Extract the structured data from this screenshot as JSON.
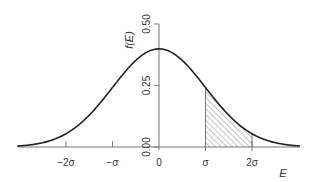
{
  "chart_data": {
    "type": "line",
    "title": "",
    "xlabel": "E",
    "ylabel": "f(E)",
    "x_ticks": [
      "-2σ",
      "-σ",
      "0",
      "σ",
      "2σ"
    ],
    "y_ticks": [
      "0.00",
      "0.25",
      "0.50"
    ],
    "ylim": [
      0,
      0.5
    ],
    "xlim": [
      -3,
      3
    ],
    "grid": false,
    "series": [
      {
        "name": "Normal density f(E)",
        "x": [
          -3,
          -2.5,
          -2,
          -1.5,
          -1,
          -0.5,
          0,
          0.5,
          1,
          1.5,
          2,
          2.5,
          3
        ],
        "values": [
          0.004,
          0.018,
          0.054,
          0.13,
          0.242,
          0.352,
          0.399,
          0.352,
          0.242,
          0.13,
          0.054,
          0.018,
          0.004
        ]
      }
    ],
    "shaded_region": {
      "from": "σ",
      "to": "2σ",
      "pattern": "diagonal hatch"
    },
    "colors": {
      "curve": "#222222",
      "axis": "#555555",
      "hatch": "#777777"
    }
  }
}
